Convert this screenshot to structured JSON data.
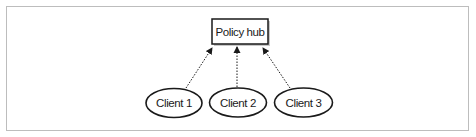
{
  "diagram": {
    "hub": {
      "label": "Policy hub"
    },
    "clients": [
      {
        "label": "Client 1"
      },
      {
        "label": "Client 2"
      },
      {
        "label": "Client 3"
      }
    ],
    "edges": [
      {
        "from": "Client 1",
        "to": "Policy hub",
        "style": "dotted-arrow"
      },
      {
        "from": "Client 2",
        "to": "Policy hub",
        "style": "dotted-arrow"
      },
      {
        "from": "Client 3",
        "to": "Policy hub",
        "style": "dotted-arrow"
      }
    ],
    "colors": {
      "stroke": "#1a1a1a",
      "frame": "#bdbdbd",
      "shadow": "#c8c8c8",
      "background": "#ffffff"
    }
  }
}
